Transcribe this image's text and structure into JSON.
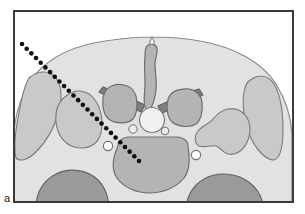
{
  "figure": {
    "panel_label": "a",
    "caption_text": "",
    "type": "medical-illustration",
    "colors": {
      "background": "#ffffff",
      "frame_border": "#3a3a3a",
      "soft_tissue_fill": "#e2e2e2",
      "soft_tissue_stroke": "#8a8a8a",
      "muscle_fill": "#c9c9c9",
      "muscle_stroke": "#7a7a7a",
      "bone_fill": "#b4b4b4",
      "bone_stroke": "#6e6e6e",
      "dark_bone_fill": "#9a9a9a",
      "dark_bone_stroke": "#636363",
      "lamina_fill": "#7f7f7f",
      "canal_fill": "#f0f0f0",
      "canal_stroke": "#7a7a7a",
      "vessel_fill": "#fdfdfd",
      "vessel_stroke": "#6e6e6e",
      "needle_dot": "#111111",
      "label_text": "#1a1a1a"
    },
    "frame": {
      "x": 13,
      "y": 10,
      "width": 281,
      "height": 193,
      "stroke_width": 2
    },
    "needle_trajectory": {
      "name": "needle-path",
      "start_x": 22,
      "start_y": 44,
      "end_x": 139,
      "end_y": 161,
      "dot_radius": 2.3,
      "dot_count": 26,
      "style": "dotted"
    },
    "structures": [
      {
        "name": "soft-tissue-body",
        "label": "body cross-section"
      },
      {
        "name": "spinous-process",
        "label": "spinous process"
      },
      {
        "name": "lamina-left",
        "label": "left lamina"
      },
      {
        "name": "lamina-right",
        "label": "right lamina"
      },
      {
        "name": "articular-process-left",
        "label": "left articular process"
      },
      {
        "name": "articular-process-right",
        "label": "right articular process"
      },
      {
        "name": "spinal-canal",
        "label": "spinal canal"
      },
      {
        "name": "vertebral-body",
        "label": "vertebral body"
      },
      {
        "name": "transverse-process-left",
        "label": "left transverse process"
      },
      {
        "name": "transverse-process-right",
        "label": "right transverse process"
      },
      {
        "name": "paraspinal-muscle-left",
        "label": "left paraspinal muscle"
      },
      {
        "name": "paraspinal-muscle-right",
        "label": "right paraspinal muscle"
      },
      {
        "name": "psoas-muscle-left",
        "label": "left psoas muscle"
      },
      {
        "name": "psoas-muscle-right",
        "label": "right psoas muscle"
      },
      {
        "name": "vessel-left",
        "label": "left vessel"
      },
      {
        "name": "vessel-right",
        "label": "right vessel"
      },
      {
        "name": "vessel-paracentral-left",
        "label": "left paracentral vessel"
      },
      {
        "name": "vessel-paracentral-right",
        "label": "right paracentral vessel"
      },
      {
        "name": "abdominal-content-left",
        "label": "left anterior structure"
      },
      {
        "name": "abdominal-content-right",
        "label": "right anterior structure"
      }
    ]
  }
}
